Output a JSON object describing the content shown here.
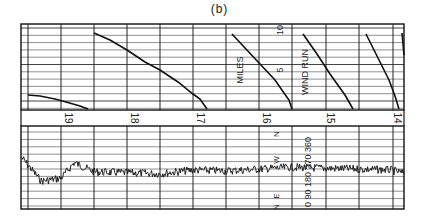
{
  "chart_data": [
    {
      "type": "line",
      "title": "(b)",
      "panel": "top",
      "ylabel": "WIND RUN (MILES)",
      "ytick_labels": [
        "5",
        "10"
      ],
      "ylim": [
        0,
        10
      ],
      "x_axis": "time of day (hours, decreasing left to right)",
      "x_ticks": [
        19,
        18,
        17,
        16,
        15,
        14
      ],
      "description": "Cumulative wind-run trace, resets after every 10 miles; sawtooth segments",
      "series": [
        {
          "name": "wind-run-segment-1",
          "points": [
            [
              28,
              95
            ],
            [
              40,
              96
            ],
            [
              55,
              99
            ],
            [
              66,
              102
            ],
            [
              80,
              106
            ],
            [
              88,
              109
            ]
          ]
        },
        {
          "name": "wind-run-segment-2",
          "points": [
            [
              94,
              33
            ],
            [
              110,
              40
            ],
            [
              127,
              50
            ],
            [
              145,
              62
            ],
            [
              160,
              70
            ],
            [
              178,
              82
            ],
            [
              193,
              94
            ],
            [
              200,
              99
            ],
            [
              207,
              109
            ]
          ]
        },
        {
          "name": "wind-run-segment-3",
          "points": [
            [
              232,
              34
            ],
            [
              245,
              48
            ],
            [
              260,
              64
            ],
            [
              275,
              80
            ],
            [
              284,
              93
            ],
            [
              289,
              100
            ],
            [
              292,
              109
            ]
          ]
        },
        {
          "name": "wind-run-segment-4",
          "points": [
            [
              303,
              34
            ],
            [
              317,
              54
            ],
            [
              330,
              74
            ],
            [
              345,
              95
            ],
            [
              353,
              109
            ]
          ]
        },
        {
          "name": "wind-run-segment-5",
          "points": [
            [
              366,
              34
            ],
            [
              375,
              52
            ],
            [
              389,
              80
            ],
            [
              395,
              96
            ],
            [
              399,
              109
            ]
          ]
        },
        {
          "name": "wind-run-segment-6",
          "points": [
            [
              402,
              33
            ],
            [
              404,
              55
            ]
          ]
        }
      ]
    },
    {
      "type": "line",
      "panel": "bottom",
      "ylabel": "WIND DIRECTION",
      "ytick_labels_degrees": [
        "0",
        "90",
        "180",
        "270",
        "360"
      ],
      "ytick_labels_compass": [
        "N",
        "E",
        "S",
        "W",
        "N"
      ],
      "ylim": [
        0,
        360
      ],
      "x_ticks": [
        19,
        18,
        17,
        16,
        15,
        14
      ],
      "description": "Wind direction trace, noisy; mostly around 160-200 degrees; early period near 250 then dip near 120",
      "approx_values_deg": [
        {
          "hour": 19.6,
          "deg": 250
        },
        {
          "hour": 19.3,
          "deg": 120
        },
        {
          "hour": 19.0,
          "deg": 135
        },
        {
          "hour": 18.8,
          "deg": 220
        },
        {
          "hour": 18.5,
          "deg": 170
        },
        {
          "hour": 18.0,
          "deg": 165
        },
        {
          "hour": 17.5,
          "deg": 160
        },
        {
          "hour": 17.0,
          "deg": 180
        },
        {
          "hour": 16.5,
          "deg": 175
        },
        {
          "hour": 16.0,
          "deg": 185
        },
        {
          "hour": 15.5,
          "deg": 195
        },
        {
          "hour": 15.0,
          "deg": 190
        },
        {
          "hour": 14.5,
          "deg": 185
        },
        {
          "hour": 14.0,
          "deg": 180
        },
        {
          "hour": 13.8,
          "deg": 160
        }
      ]
    }
  ],
  "labels": {
    "title": "(b)",
    "hours": [
      "19",
      "18",
      "17",
      "16",
      "15",
      "14"
    ],
    "miles": "MILES",
    "wind_run": "WIND RUN",
    "miles_ticks": [
      "10",
      "5"
    ],
    "compass": [
      "N",
      "W",
      "E",
      "N"
    ],
    "degrees": [
      "0",
      "90",
      "180",
      "270",
      "360"
    ]
  }
}
